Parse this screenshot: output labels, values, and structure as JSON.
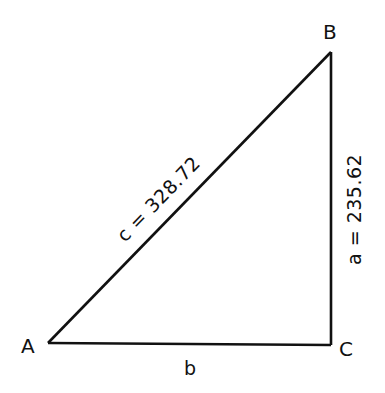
{
  "diagram": {
    "type": "right-triangle",
    "vertices": {
      "A": {
        "label": "A"
      },
      "B": {
        "label": "B"
      },
      "C": {
        "label": "C"
      }
    },
    "sides": {
      "a": {
        "label": "a = 235.62",
        "name": "a",
        "value": 235.62,
        "between": [
          "B",
          "C"
        ]
      },
      "b": {
        "label": "b",
        "name": "b",
        "between": [
          "A",
          "C"
        ]
      },
      "c": {
        "label": "c = 328.72",
        "name": "c",
        "value": 328.72,
        "between": [
          "A",
          "B"
        ]
      }
    },
    "right_angle_at": "C",
    "colors": {
      "stroke": "#111111",
      "background": "#ffffff"
    }
  }
}
